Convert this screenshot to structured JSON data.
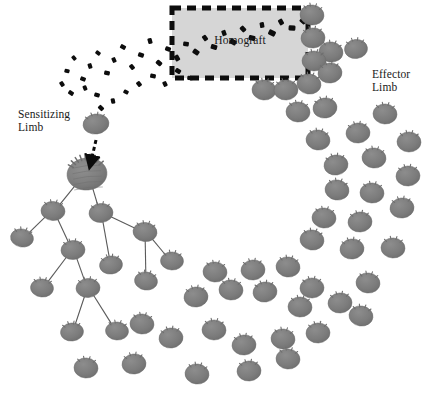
{
  "figure": {
    "width": 428,
    "height": 394,
    "background_color": "#ffffff"
  },
  "labels": {
    "homograft": "Homograft",
    "sensitizing_limb": "Sensitizing\nLimb",
    "effector_limb": "Effector\nLimb"
  },
  "caption": {
    "cropped_text": ""
  },
  "colors": {
    "cell_fill": "#7e7e7e",
    "cell_fill_dark": "#6f6f6f",
    "cell_stroke": "#6a6a6a",
    "large_cell_fill": "#808080",
    "antigen_particle": "#0d0d0d",
    "graft_fill": "#d6d6d6",
    "graft_border": "#0d0d0d",
    "link_line": "#5a5a5a",
    "text": "#1a1a1a",
    "background": "#ffffff"
  },
  "graft_box": {
    "x": 172,
    "y": 8,
    "width": 136,
    "height": 70,
    "fill": "#d6d6d6",
    "border_style": "dashed",
    "border_color": "#0d0d0d",
    "border_width": 5,
    "dash_length": 9,
    "dash_gap": 6
  },
  "antigen_particles": [
    {
      "x": 316,
      "y": 16,
      "r": 4.0,
      "rot": 18
    },
    {
      "x": 303,
      "y": 21,
      "r": 3.4,
      "rot": 40
    },
    {
      "x": 292,
      "y": 28,
      "r": 3.6,
      "rot": 5
    },
    {
      "x": 281,
      "y": 22,
      "r": 3.2,
      "rot": 62
    },
    {
      "x": 272,
      "y": 33,
      "r": 3.8,
      "rot": 25
    },
    {
      "x": 262,
      "y": 25,
      "r": 3.0,
      "rot": 80
    },
    {
      "x": 252,
      "y": 38,
      "r": 3.5,
      "rot": 12
    },
    {
      "x": 243,
      "y": 29,
      "r": 3.2,
      "rot": 47
    },
    {
      "x": 233,
      "y": 42,
      "r": 3.6,
      "rot": 30
    },
    {
      "x": 224,
      "y": 33,
      "r": 3.0,
      "rot": 70
    },
    {
      "x": 214,
      "y": 47,
      "r": 3.4,
      "rot": 15
    },
    {
      "x": 205,
      "y": 38,
      "r": 3.1,
      "rot": 55
    },
    {
      "x": 196,
      "y": 52,
      "r": 3.5,
      "rot": 35
    },
    {
      "x": 186,
      "y": 44,
      "r": 3.0,
      "rot": 8
    },
    {
      "x": 177,
      "y": 58,
      "r": 3.3,
      "rot": 60
    },
    {
      "x": 168,
      "y": 49,
      "r": 3.0,
      "rot": 20
    },
    {
      "x": 159,
      "y": 63,
      "r": 3.2,
      "rot": 42
    },
    {
      "x": 150,
      "y": 41,
      "r": 3.0,
      "rot": 75
    },
    {
      "x": 141,
      "y": 55,
      "r": 3.1,
      "rot": 18
    },
    {
      "x": 132,
      "y": 67,
      "r": 2.9,
      "rot": 50
    },
    {
      "x": 123,
      "y": 47,
      "r": 3.0,
      "rot": 28
    },
    {
      "x": 114,
      "y": 60,
      "r": 2.8,
      "rot": 66
    },
    {
      "x": 107,
      "y": 73,
      "r": 3.0,
      "rot": 10
    },
    {
      "x": 98,
      "y": 53,
      "r": 2.7,
      "rot": 38
    },
    {
      "x": 90,
      "y": 66,
      "r": 2.8,
      "rot": 72
    },
    {
      "x": 83,
      "y": 79,
      "r": 2.9,
      "rot": 22
    },
    {
      "x": 74,
      "y": 58,
      "r": 2.6,
      "rot": 48
    },
    {
      "x": 67,
      "y": 71,
      "r": 2.7,
      "rot": 14
    },
    {
      "x": 62,
      "y": 84,
      "r": 2.8,
      "rot": 58
    },
    {
      "x": 71,
      "y": 93,
      "r": 2.9,
      "rot": 33
    },
    {
      "x": 85,
      "y": 88,
      "r": 2.7,
      "rot": 68
    },
    {
      "x": 97,
      "y": 95,
      "r": 2.9,
      "rot": 16
    },
    {
      "x": 101,
      "y": 108,
      "r": 3.0,
      "rot": 44
    },
    {
      "x": 113,
      "y": 101,
      "r": 2.8,
      "rot": 78
    },
    {
      "x": 126,
      "y": 92,
      "r": 2.7,
      "rot": 26
    },
    {
      "x": 139,
      "y": 84,
      "r": 2.9,
      "rot": 52
    },
    {
      "x": 153,
      "y": 76,
      "r": 3.0,
      "rot": 9
    },
    {
      "x": 165,
      "y": 84,
      "r": 2.8,
      "rot": 64
    },
    {
      "x": 178,
      "y": 71,
      "r": 3.1,
      "rot": 31
    },
    {
      "x": 190,
      "y": 78,
      "r": 2.9,
      "rot": 6
    }
  ],
  "sensitizing_cell": {
    "x": 96,
    "y": 124,
    "rx": 13,
    "ry": 10,
    "rot": -8
  },
  "large_activated_cell": {
    "x": 87,
    "y": 174,
    "rx": 20,
    "ry": 16,
    "rot": -6
  },
  "entry_arrow": {
    "x1": 96,
    "y1": 140,
    "x2": 90,
    "y2": 166,
    "style": "dashed",
    "color": "#0d0d0d",
    "width": 3
  },
  "tree_cells": [
    {
      "id": "t0",
      "x": 87,
      "y": 174,
      "rx": 20,
      "ry": 16,
      "rot": -6,
      "large": true
    },
    {
      "id": "t1",
      "x": 53,
      "y": 211,
      "rx": 12,
      "ry": 9.5,
      "rot": 4
    },
    {
      "id": "t2",
      "x": 101,
      "y": 213,
      "rx": 12,
      "ry": 9.5,
      "rot": -5
    },
    {
      "id": "t3",
      "x": 22,
      "y": 238,
      "rx": 11.5,
      "ry": 9,
      "rot": 10
    },
    {
      "id": "t4",
      "x": 73,
      "y": 250,
      "rx": 12,
      "ry": 9.5,
      "rot": -3
    },
    {
      "id": "t5",
      "x": 145,
      "y": 232,
      "rx": 12,
      "ry": 9.5,
      "rot": 7
    },
    {
      "id": "t6",
      "x": 111,
      "y": 265,
      "rx": 11.5,
      "ry": 9,
      "rot": -8
    },
    {
      "id": "t7",
      "x": 172,
      "y": 261,
      "rx": 11.5,
      "ry": 9,
      "rot": 3
    },
    {
      "id": "t8",
      "x": 42,
      "y": 288,
      "rx": 11.5,
      "ry": 9,
      "rot": 6
    },
    {
      "id": "t9",
      "x": 88,
      "y": 288,
      "rx": 12,
      "ry": 9.5,
      "rot": -4
    },
    {
      "id": "t10",
      "x": 146,
      "y": 281,
      "rx": 11.5,
      "ry": 9,
      "rot": 9
    },
    {
      "id": "t11",
      "x": 72,
      "y": 332,
      "rx": 11.5,
      "ry": 9,
      "rot": -6
    },
    {
      "id": "t12",
      "x": 117,
      "y": 331,
      "rx": 11.5,
      "ry": 9,
      "rot": 5
    }
  ],
  "tree_links": [
    {
      "from": "t0",
      "to": "t1"
    },
    {
      "from": "t0",
      "to": "t2"
    },
    {
      "from": "t1",
      "to": "t3"
    },
    {
      "from": "t1",
      "to": "t4"
    },
    {
      "from": "t2",
      "to": "t5"
    },
    {
      "from": "t2",
      "to": "t6"
    },
    {
      "from": "t5",
      "to": "t7"
    },
    {
      "from": "t4",
      "to": "t8"
    },
    {
      "from": "t4",
      "to": "t9"
    },
    {
      "from": "t5",
      "to": "t10"
    },
    {
      "from": "t9",
      "to": "t11"
    },
    {
      "from": "t9",
      "to": "t12"
    }
  ],
  "effector_cells": [
    {
      "x": 312,
      "y": 15,
      "rx": 12,
      "ry": 10,
      "rot": 6
    },
    {
      "x": 313,
      "y": 38,
      "rx": 12,
      "ry": 10,
      "rot": -4
    },
    {
      "x": 331,
      "y": 52,
      "rx": 12,
      "ry": 10,
      "rot": 9
    },
    {
      "x": 314,
      "y": 61,
      "rx": 12,
      "ry": 10,
      "rot": 2
    },
    {
      "x": 356,
      "y": 49,
      "rx": 11.5,
      "ry": 9.5,
      "rot": -7
    },
    {
      "x": 264,
      "y": 90,
      "rx": 12,
      "ry": 10,
      "rot": 5
    },
    {
      "x": 286,
      "y": 90,
      "rx": 12,
      "ry": 10,
      "rot": -3
    },
    {
      "x": 309,
      "y": 84,
      "rx": 12,
      "ry": 10,
      "rot": 8
    },
    {
      "x": 330,
      "y": 73,
      "rx": 12,
      "ry": 10,
      "rot": -6
    },
    {
      "x": 298,
      "y": 112,
      "rx": 12,
      "ry": 10,
      "rot": 4
    },
    {
      "x": 325,
      "y": 108,
      "rx": 12,
      "ry": 10,
      "rot": -9
    },
    {
      "x": 385,
      "y": 114,
      "rx": 12,
      "ry": 10,
      "rot": 3
    },
    {
      "x": 318,
      "y": 140,
      "rx": 12,
      "ry": 10,
      "rot": 7
    },
    {
      "x": 358,
      "y": 133,
      "rx": 12,
      "ry": 10,
      "rot": -5
    },
    {
      "x": 409,
      "y": 142,
      "rx": 12,
      "ry": 10,
      "rot": 2
    },
    {
      "x": 336,
      "y": 165,
      "rx": 12,
      "ry": 10,
      "rot": -8
    },
    {
      "x": 374,
      "y": 158,
      "rx": 12,
      "ry": 10,
      "rot": 6
    },
    {
      "x": 408,
      "y": 176,
      "rx": 12,
      "ry": 10,
      "rot": -3
    },
    {
      "x": 337,
      "y": 190,
      "rx": 12,
      "ry": 10,
      "rot": 9
    },
    {
      "x": 372,
      "y": 193,
      "rx": 12,
      "ry": 10,
      "rot": 4
    },
    {
      "x": 402,
      "y": 208,
      "rx": 12,
      "ry": 10,
      "rot": -6
    },
    {
      "x": 324,
      "y": 218,
      "rx": 12,
      "ry": 10,
      "rot": 5
    },
    {
      "x": 360,
      "y": 222,
      "rx": 12,
      "ry": 10,
      "rot": -4
    },
    {
      "x": 312,
      "y": 240,
      "rx": 12,
      "ry": 10,
      "rot": 8
    },
    {
      "x": 352,
      "y": 249,
      "rx": 12,
      "ry": 10,
      "rot": -7
    },
    {
      "x": 393,
      "y": 248,
      "rx": 12,
      "ry": 10,
      "rot": 3
    },
    {
      "x": 215,
      "y": 272,
      "rx": 12,
      "ry": 10,
      "rot": 5
    },
    {
      "x": 253,
      "y": 270,
      "rx": 12,
      "ry": 10,
      "rot": -5
    },
    {
      "x": 288,
      "y": 267,
      "rx": 12,
      "ry": 10,
      "rot": 7
    },
    {
      "x": 312,
      "y": 288,
      "rx": 12,
      "ry": 10,
      "rot": -2
    },
    {
      "x": 368,
      "y": 283,
      "rx": 12,
      "ry": 10,
      "rot": 6
    },
    {
      "x": 196,
      "y": 297,
      "rx": 12,
      "ry": 10,
      "rot": -6
    },
    {
      "x": 231,
      "y": 290,
      "rx": 12,
      "ry": 10,
      "rot": 4
    },
    {
      "x": 265,
      "y": 292,
      "rx": 12,
      "ry": 10,
      "rot": -8
    },
    {
      "x": 300,
      "y": 307,
      "rx": 12,
      "ry": 10,
      "rot": 3
    },
    {
      "x": 340,
      "y": 303,
      "rx": 12,
      "ry": 10,
      "rot": -4
    },
    {
      "x": 361,
      "y": 316,
      "rx": 12,
      "ry": 10,
      "rot": 8
    },
    {
      "x": 142,
      "y": 324,
      "rx": 12,
      "ry": 10,
      "rot": 5
    },
    {
      "x": 171,
      "y": 338,
      "rx": 12,
      "ry": 10,
      "rot": -7
    },
    {
      "x": 214,
      "y": 330,
      "rx": 12,
      "ry": 10,
      "rot": 2
    },
    {
      "x": 244,
      "y": 345,
      "rx": 12,
      "ry": 10,
      "rot": -5
    },
    {
      "x": 283,
      "y": 339,
      "rx": 12,
      "ry": 10,
      "rot": 6
    },
    {
      "x": 318,
      "y": 333,
      "rx": 12,
      "ry": 10,
      "rot": -3
    },
    {
      "x": 86,
      "y": 368,
      "rx": 12,
      "ry": 10,
      "rot": 4
    },
    {
      "x": 134,
      "y": 364,
      "rx": 12,
      "ry": 10,
      "rot": -6
    },
    {
      "x": 197,
      "y": 374,
      "rx": 12,
      "ry": 10,
      "rot": 7
    },
    {
      "x": 249,
      "y": 371,
      "rx": 12,
      "ry": 10,
      "rot": -4
    },
    {
      "x": 288,
      "y": 359,
      "rx": 12,
      "ry": 10,
      "rot": 5
    }
  ]
}
